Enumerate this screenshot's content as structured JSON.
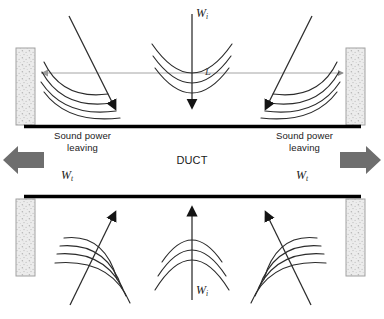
{
  "figure": {
    "type": "acoustic-duct-transmission-diagram",
    "title_visible": false,
    "background": "#ffffff"
  },
  "colors": {
    "wave_line": "#2b2b2b",
    "duct_wall": "#000000",
    "insulation_fill": "#e8e8e8",
    "insulation_border": "#9a9a9a",
    "speckle": "#b9b9b9",
    "gray_arrow": "#6e6e6e",
    "axis_line": "#8c8c8c",
    "text": "#1a1a1a"
  },
  "labels": {
    "duct": "DUCT",
    "sound_power_left": "Sound power\nleaving",
    "sound_power_right": "Sound power\nleaving",
    "incident_top": {
      "base": "W",
      "sub": "i"
    },
    "incident_bottom": {
      "base": "W",
      "sub": "i"
    },
    "transmitted_left": {
      "base": "W",
      "sub": "t"
    },
    "transmitted_right": {
      "base": "W",
      "sub": "t"
    },
    "length": "L"
  },
  "elements": {
    "insulation_blocks": [
      {
        "name": "upper-left-absorber",
        "x": 16,
        "y": 48,
        "w": 19,
        "h": 76
      },
      {
        "name": "upper-right-absorber",
        "x": 345,
        "y": 48,
        "w": 19,
        "h": 76
      },
      {
        "name": "lower-left-absorber",
        "x": 16,
        "y": 203,
        "w": 19,
        "h": 76
      },
      {
        "name": "lower-right-absorber",
        "x": 345,
        "y": 203,
        "w": 19,
        "h": 76
      }
    ],
    "duct_walls": [
      {
        "name": "upper-duct-wall",
        "x1": 24,
        "y1": 126,
        "x2": 360,
        "y2": 126
      },
      {
        "name": "lower-duct-wall",
        "x1": 24,
        "y1": 197,
        "x2": 360,
        "y2": 197
      }
    ],
    "length_arrow": {
      "name": "duct-length-dimension-arrow",
      "x1": 38,
      "x2": 344,
      "y": 73
    },
    "gray_arrows": [
      {
        "name": "sound-power-leaving-left-arrow",
        "direction": "left"
      },
      {
        "name": "sound-power-leaving-right-arrow",
        "direction": "right"
      }
    ],
    "wave_groups": [
      {
        "name": "upper-left-wavefronts",
        "arcs": 4,
        "direction": "down-right"
      },
      {
        "name": "upper-center-wavefronts",
        "arcs": 3,
        "direction": "down"
      },
      {
        "name": "upper-right-wavefronts",
        "arcs": 4,
        "direction": "down-left"
      },
      {
        "name": "lower-left-wavefronts",
        "arcs": 4,
        "direction": "up-right"
      },
      {
        "name": "lower-center-wavefronts",
        "arcs": 3,
        "direction": "up"
      },
      {
        "name": "lower-right-wavefronts",
        "arcs": 4,
        "direction": "up-left"
      }
    ]
  }
}
